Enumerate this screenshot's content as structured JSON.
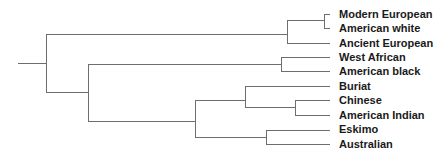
{
  "diagram": {
    "type": "dendrogram",
    "orientation": "left-to-right",
    "line_color": "#6e6e6e",
    "label_color": "#1a1a1a",
    "leaves": [
      {
        "label": "Modern European",
        "y": 14
      },
      {
        "label": "American white",
        "y": 28
      },
      {
        "label": "Ancient European",
        "y": 43
      },
      {
        "label": "West African",
        "y": 57
      },
      {
        "label": "American black",
        "y": 71
      },
      {
        "label": "Buriat",
        "y": 86
      },
      {
        "label": "Chinese",
        "y": 100
      },
      {
        "label": "American Indian",
        "y": 115
      },
      {
        "label": "Eskimo",
        "y": 129
      },
      {
        "label": "Australian",
        "y": 144
      }
    ],
    "tree": "(((Modern European, American white), Ancient European), ((West African, American black), ((Buriat, (Chinese, American Indian)), (Eskimo, Australian))))"
  }
}
